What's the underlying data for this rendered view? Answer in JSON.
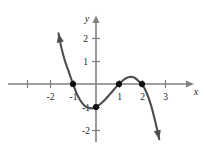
{
  "chart_data": {
    "type": "line",
    "title": "",
    "subtitle": "",
    "xlabel": "x",
    "ylabel": "y",
    "xlim": [
      -3.8,
      4.1
    ],
    "ylim": [
      -2.9,
      2.9
    ],
    "grid": false,
    "legend": null,
    "annotations": [],
    "x_tick_labels": [
      "-2",
      "-1",
      "1",
      "2",
      "3"
    ],
    "x_tick_values": [
      -2,
      -1,
      1,
      2,
      3
    ],
    "x_ticks_unlabeled": [
      -3
    ],
    "y_tick_labels": [
      "2",
      "1",
      "-1",
      "-2"
    ],
    "y_tick_values": [
      2,
      1,
      -1,
      -2
    ],
    "series": [
      {
        "name": "cubic",
        "expression": "f(x) = -0.5(x+1)(x-1)(x-2)",
        "color": "#4d4d4d",
        "arrow_start": true,
        "arrow_end": true,
        "x": [
          -1.63,
          -1.5,
          -1.35,
          -1.2,
          -1.0,
          -0.8,
          -0.6,
          -0.4,
          -0.2,
          -0.1,
          0.0,
          0.2,
          0.4,
          0.6,
          0.8,
          1.0,
          1.2,
          1.4,
          1.55,
          1.7,
          1.85,
          2.0,
          2.2,
          2.4,
          2.6,
          2.75
        ],
        "y": [
          2.2,
          1.56,
          1.0,
          0.58,
          0.0,
          -0.5,
          -0.83,
          -1.01,
          -1.06,
          -1.04,
          -1.0,
          -0.86,
          -0.67,
          -0.45,
          -0.22,
          0.0,
          0.18,
          0.29,
          0.31,
          0.26,
          0.13,
          0.0,
          -0.38,
          -0.95,
          -1.73,
          -2.4
        ]
      }
    ],
    "points": [
      {
        "label": "x-intercept",
        "x": -1,
        "y": 0
      },
      {
        "label": "y-intercept",
        "x": 0,
        "y": -1
      },
      {
        "label": "x-intercept",
        "x": 1,
        "y": 0
      },
      {
        "label": "x-intercept",
        "x": 2,
        "y": 0
      }
    ],
    "colors": {
      "curve": "#4d4d4d",
      "axis": "#808080",
      "point": "#111111",
      "text": "#1a1a1a",
      "background": "#ffffff"
    }
  }
}
